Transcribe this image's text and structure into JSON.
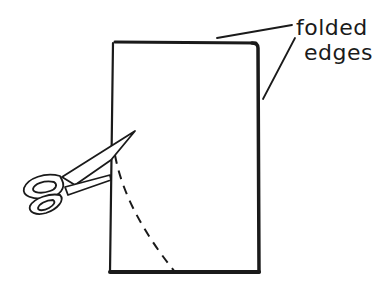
{
  "diagram": {
    "labels": {
      "line1": "folded",
      "line2": "edges"
    },
    "colors": {
      "ink": "#1a1a1a",
      "background": "#ffffff"
    },
    "elements": [
      "folded-paper-rectangle",
      "dashed-cut-line",
      "scissors-icon",
      "leader-lines"
    ]
  }
}
